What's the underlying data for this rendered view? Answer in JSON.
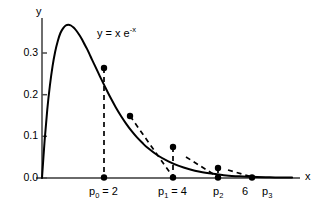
{
  "figure": {
    "title": "",
    "equation_label": "y = x e",
    "equation_exponent": "-x",
    "y_axis_label": "y",
    "x_axis_label": "x"
  },
  "axes": {
    "y_ticks": [
      "0.0",
      "0.1",
      "0.2",
      "0.3"
    ],
    "y_tick_values": [
      0.0,
      0.1,
      0.2,
      0.3
    ],
    "x_tick_six": "6"
  },
  "points": {
    "p0_base": "p",
    "p0_sub": "0",
    "p0_eq": " = 2",
    "p1_base": "p",
    "p1_sub": "1",
    "p1_eq": " = 4",
    "p2_base": "p",
    "p2_sub": "2",
    "p3_base": "p",
    "p3_sub": "3"
  },
  "colors": {
    "curve": "#000000",
    "axis": "#555555",
    "dashed": "#000000",
    "marker": "#000000",
    "background": "#ffffff"
  },
  "chart_data": {
    "type": "line",
    "title": "",
    "xlabel": "x",
    "ylabel": "y",
    "xlim": [
      0,
      9.8
    ],
    "ylim": [
      0.0,
      0.4
    ],
    "grid": false,
    "legend": "none",
    "function": "y = x * exp(-x)",
    "annotations": [
      {
        "text": "y = x e^-x",
        "x": 2.6,
        "y": 0.345
      },
      {
        "text": "p_0 = 2",
        "x": 2.0,
        "y": -0.035
      },
      {
        "text": "p_1 = 4",
        "x": 4.0,
        "y": -0.035
      },
      {
        "text": "p_2",
        "x": 5.6,
        "y": -0.035
      },
      {
        "text": "6",
        "x": 6.4,
        "y": -0.035
      },
      {
        "text": "p_3",
        "x": 7.0,
        "y": -0.035
      }
    ],
    "series": [
      {
        "name": "y = x e^{-x}",
        "style": "solid",
        "x": [
          0.0,
          0.1,
          0.2,
          0.3,
          0.4,
          0.5,
          0.6,
          0.7,
          0.8,
          0.9,
          1.0,
          1.1,
          1.2,
          1.3,
          1.4,
          1.5,
          1.6,
          1.7,
          1.8,
          1.9,
          2.0,
          2.2,
          2.4,
          2.6,
          2.8,
          3.0,
          3.2,
          3.4,
          3.6,
          3.8,
          4.0,
          4.4,
          4.8,
          5.2,
          5.6,
          6.0,
          6.5,
          7.0,
          7.5,
          8.0,
          8.5,
          9.0,
          9.5
        ],
        "y": [
          0.0,
          0.09,
          0.164,
          0.222,
          0.268,
          0.303,
          0.329,
          0.348,
          0.359,
          0.366,
          0.368,
          0.366,
          0.361,
          0.354,
          0.345,
          0.335,
          0.323,
          0.311,
          0.298,
          0.284,
          0.271,
          0.244,
          0.218,
          0.193,
          0.17,
          0.149,
          0.13,
          0.113,
          0.098,
          0.085,
          0.073,
          0.054,
          0.04,
          0.029,
          0.021,
          0.015,
          0.01,
          0.006,
          0.004,
          0.003,
          0.002,
          0.001,
          0.001
        ]
      },
      {
        "name": "secant-iteration",
        "style": "dashed",
        "points": [
          {
            "label": "p0_on_curve",
            "x": 2.0,
            "y": 0.271
          },
          {
            "label": "p0_on_axis",
            "x": 2.0,
            "y": 0.0
          },
          {
            "label": "mid_on_curve",
            "x": 3.0,
            "y": 0.149
          },
          {
            "label": "p1_on_axis",
            "x": 4.0,
            "y": 0.0
          },
          {
            "label": "p1_on_curve",
            "x": 4.0,
            "y": 0.073
          },
          {
            "label": "p2_on_curve",
            "x": 5.6,
            "y": 0.021
          },
          {
            "label": "p2_on_axis",
            "x": 5.6,
            "y": 0.0
          },
          {
            "label": "p3_on_axis",
            "x": 7.0,
            "y": 0.0
          }
        ]
      }
    ],
    "marked_points": [
      {
        "name": "p0-curve",
        "x": 2.0,
        "y": 0.271
      },
      {
        "name": "p0-axis",
        "x": 2.0,
        "y": 0.0
      },
      {
        "name": "mid-curve",
        "x": 3.0,
        "y": 0.149
      },
      {
        "name": "p1-axis",
        "x": 4.0,
        "y": 0.0
      },
      {
        "name": "p1-curve",
        "x": 4.0,
        "y": 0.073
      },
      {
        "name": "p2-curve",
        "x": 5.6,
        "y": 0.021
      },
      {
        "name": "p2-axis",
        "x": 5.6,
        "y": 0.0
      },
      {
        "name": "p3-axis",
        "x": 7.0,
        "y": 0.0
      }
    ]
  }
}
